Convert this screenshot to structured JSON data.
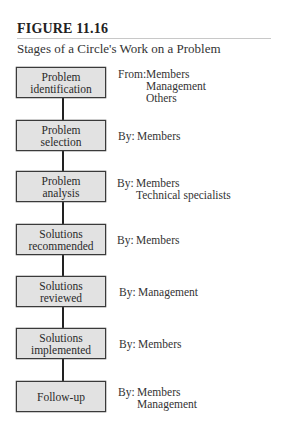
{
  "figure": {
    "label": "FIGURE 11.16",
    "title": "Stages of a Circle's Work on a Problem"
  },
  "stages": [
    {
      "line1": "Problem",
      "line2": "identification",
      "prefix": "From:",
      "actors": [
        "Members",
        "Management",
        "Others"
      ]
    },
    {
      "line1": "Problem",
      "line2": "selection",
      "prefix": "By:",
      "actors": [
        "Members"
      ]
    },
    {
      "line1": "Problem",
      "line2": "analysis",
      "prefix": "By:",
      "actors": [
        "Members",
        "Technical specialists"
      ]
    },
    {
      "line1": "Solutions",
      "line2": "recommended",
      "prefix": "By:",
      "actors": [
        "Members"
      ]
    },
    {
      "line1": "Solutions",
      "line2": "reviewed",
      "prefix": "By:",
      "actors": [
        "Management"
      ]
    },
    {
      "line1": "Solutions",
      "line2": "implemented",
      "prefix": "By:",
      "actors": [
        "Members"
      ]
    },
    {
      "line1": "Follow-up",
      "line2": "",
      "prefix": "By:",
      "actors": [
        "Members",
        "Management"
      ]
    }
  ],
  "colors": {
    "box_fill": "#e2e2e2",
    "box_border": "#3a3a3a",
    "connector": "#222222"
  }
}
